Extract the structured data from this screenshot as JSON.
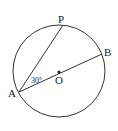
{
  "diagram": {
    "type": "geometry-circle",
    "circle": {
      "center": "O",
      "cx": 59,
      "cy": 71,
      "r": 46
    },
    "points": {
      "A": {
        "label": "A",
        "x": 19,
        "y": 92
      },
      "P": {
        "label": "P",
        "x": 63,
        "y": 25
      },
      "B": {
        "label": "B",
        "x": 102,
        "y": 54
      },
      "O": {
        "label": "O",
        "x": 59,
        "y": 71
      }
    },
    "segments": [
      [
        "A",
        "P"
      ],
      [
        "A",
        "B"
      ]
    ],
    "angle": {
      "vertex": "A",
      "between": [
        "P",
        "B"
      ],
      "label": "30°"
    },
    "stroke_color": "#333333"
  }
}
